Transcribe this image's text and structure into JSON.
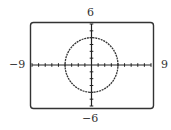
{
  "labels": {
    "ymax": "6",
    "ymin": "−6",
    "xmin": "−9",
    "xmax": "9"
  },
  "chart_data": {
    "type": "line",
    "title": "",
    "equation": "x^2 + y^2 = 16",
    "center": [
      0,
      0
    ],
    "radius": 4,
    "xlim": [
      -9,
      9
    ],
    "ylim": [
      -6,
      6
    ],
    "xscl": 1,
    "yscl": 1,
    "xlabel": "",
    "ylabel": "",
    "x_tick_labels": [
      "−9",
      "9"
    ],
    "y_tick_labels": [
      "−6",
      "6"
    ],
    "grid": false,
    "legend": null,
    "series": [
      {
        "name": "circle",
        "points": [
          [
            4,
            0
          ],
          [
            2.83,
            2.83
          ],
          [
            0,
            4
          ],
          [
            -2.83,
            2.83
          ],
          [
            -4,
            0
          ],
          [
            -2.83,
            -2.83
          ],
          [
            0,
            -4
          ],
          [
            2.83,
            -2.83
          ],
          [
            4,
            0
          ]
        ]
      }
    ],
    "colors": {
      "frame": "#333333",
      "axes": "#222222",
      "curve": "#333333"
    }
  }
}
